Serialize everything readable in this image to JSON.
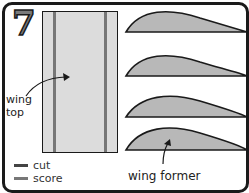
{
  "step": {
    "number": "7"
  },
  "labels": {
    "wing_top": [
      "wing",
      "top"
    ],
    "wing_former": "wing former"
  },
  "legend": [
    {
      "label": "cut",
      "color": "#444444"
    },
    {
      "label": "score",
      "color": "#777777"
    }
  ],
  "colors": {
    "outline": "#1a1a1a",
    "fill": "#b8b8b8",
    "sheet": "#dcdcdc"
  },
  "formers": {
    "count": 4
  }
}
